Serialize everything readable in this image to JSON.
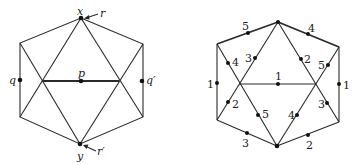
{
  "left_figure": {
    "labels": {
      "x": "x",
      "y": "y",
      "r": "r",
      "r_prime": "r′",
      "p": "p",
      "q": "q",
      "q_prime": "q′"
    }
  },
  "right_figure": {
    "edge_labels": {
      "top_left": "5",
      "top_right": "4",
      "left_side": "1",
      "right_side": "1",
      "bottom_left": "3",
      "bottom_right": "2",
      "middle": "1",
      "inner_top_left": "3",
      "inner_top_right": "2",
      "upper_left_diag": "4",
      "upper_right_diag": "5",
      "lower_left_diag": "2",
      "lower_right_diag": "3",
      "inner_bottom_left": "5",
      "inner_bottom_right": "4"
    }
  }
}
